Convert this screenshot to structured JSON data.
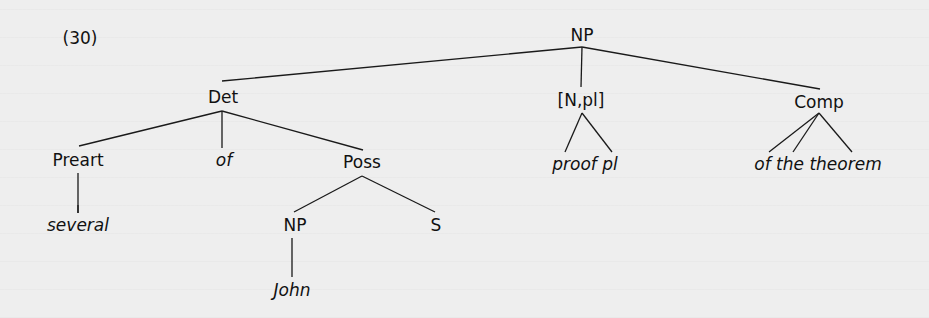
{
  "example_number": "(30)",
  "tree": {
    "root": "NP",
    "nodes": {
      "np_root": "NP",
      "det": "Det",
      "n_pl": "[N,pl]",
      "comp": "Comp",
      "preart": "Preart",
      "of": "of",
      "poss": "Poss",
      "several": "several",
      "np_inner": "NP",
      "s": "S",
      "john": "John",
      "proof_pl": "proof pl",
      "of_the_theorem": "of the theorem"
    },
    "structure": [
      {
        "label": "NP",
        "children": [
          {
            "label": "Det",
            "children": [
              {
                "label": "Preart",
                "children": [
                  {
                    "label": "several",
                    "terminal": true
                  }
                ]
              },
              {
                "label": "of",
                "terminal": true
              },
              {
                "label": "Poss",
                "children": [
                  {
                    "label": "NP",
                    "children": [
                      {
                        "label": "John",
                        "terminal": true
                      }
                    ]
                  },
                  {
                    "label": "S"
                  }
                ]
              }
            ]
          },
          {
            "label": "[N,pl]",
            "children": [
              {
                "label": "proof pl",
                "terminal": true
              }
            ]
          },
          {
            "label": "Comp",
            "children": [
              {
                "label": "of the theorem",
                "terminal": true
              }
            ]
          }
        ]
      }
    ]
  },
  "colors": {
    "background": "#ededed",
    "ink": "#111111"
  }
}
